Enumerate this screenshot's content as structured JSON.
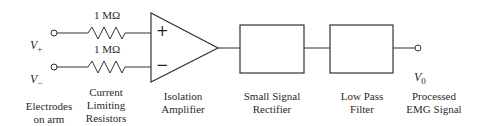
{
  "inputs": {
    "positive_label": "V",
    "positive_sub": "+",
    "negative_label": "V",
    "negative_sub": "−"
  },
  "resistors": [
    {
      "value": "1 MΩ"
    },
    {
      "value": "1 MΩ"
    }
  ],
  "amplifier": {
    "plus_sign": "+",
    "minus_sign": "−"
  },
  "output": {
    "label": "V",
    "sub": "0"
  },
  "captions": {
    "electrodes": "Electrodes\non arm",
    "resistors": "Current\nLimiting\nResistors",
    "amplifier": "Isolation\nAmplifier",
    "rectifier": "Small Signal\nRectifier",
    "filter": "Low Pass\nFilter",
    "output": "Processed\nEMG Signal"
  },
  "colors": {
    "line": "#333333",
    "background": "#ffffff"
  }
}
